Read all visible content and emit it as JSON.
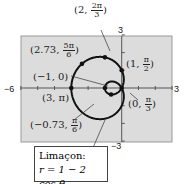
{
  "chart_data": {
    "type": "line",
    "title": "Limaçon: r = 1 − 2 cos θ",
    "xlabel": "",
    "ylabel": "",
    "xlim": [
      -6,
      3
    ],
    "ylim": [
      -3,
      3
    ],
    "grid": false,
    "series": [
      {
        "name": "r = 1 − 2 cos θ",
        "equation": "r = 1 - 2 cos θ"
      }
    ],
    "points": [
      {
        "label": "(2, 2π/3)",
        "r": 2,
        "theta": "2π/3"
      },
      {
        "label": "(2.73, 5π/6)",
        "r": 2.73,
        "theta": "5π/6"
      },
      {
        "label": "(1, π/2)",
        "r": 1,
        "theta": "π/2"
      },
      {
        "label": "(−1, 0)",
        "r": -1,
        "theta": "0"
      },
      {
        "label": "(3, π)",
        "r": 3,
        "theta": "π"
      },
      {
        "label": "(0, π/3)",
        "r": 0,
        "theta": "π/3"
      },
      {
        "label": "(−0.73, π/6)",
        "r": -0.73,
        "theta": "π/6"
      }
    ]
  },
  "axes": {
    "xmin": "−6",
    "xmax": "3",
    "ymax": "3",
    "ymin": "−3"
  },
  "labels": {
    "p1": {
      "a": "2,",
      "n": "2π",
      "d": "3"
    },
    "p2": {
      "a": "2.73,",
      "n": "5π",
      "d": "6"
    },
    "p3": {
      "a": "1,",
      "n": "π",
      "d": "2"
    },
    "p4": "(−1, 0)",
    "p5": "(3, π)",
    "p6": {
      "a": "0,",
      "n": "π",
      "d": "3"
    },
    "p7": {
      "a": "−0.73,",
      "n": "π",
      "d": "6"
    }
  },
  "caption": {
    "line1": "Limaçon:",
    "line2": "r = 1 − 2 cos θ"
  }
}
